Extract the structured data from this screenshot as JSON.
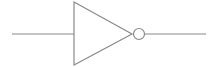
{
  "diagram": {
    "type": "logic-gate",
    "gate": "NOT",
    "colors": {
      "stroke": "#8a8a8a",
      "background": "#ffffff"
    },
    "geometry": {
      "input_line": {
        "x1": 12,
        "y1": 34,
        "x2": 74,
        "y2": 34
      },
      "triangle": {
        "points": "74,2 74,65 132,34"
      },
      "bubble": {
        "cx": 139,
        "cy": 34,
        "r": 5.5
      },
      "output_line": {
        "x1": 145,
        "y1": 34,
        "x2": 206,
        "y2": 34
      }
    }
  }
}
